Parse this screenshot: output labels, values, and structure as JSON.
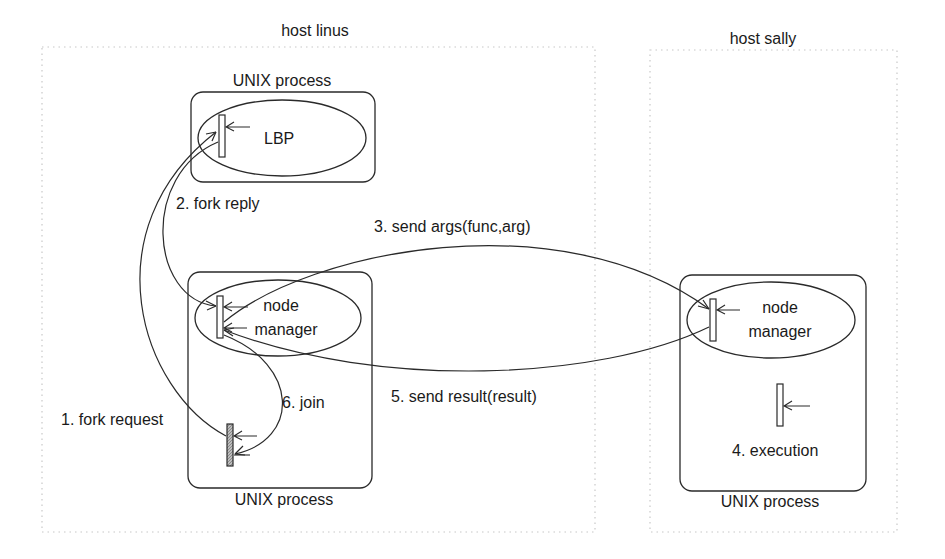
{
  "diagram": {
    "hosts": [
      {
        "id": "linus",
        "label": "host linus"
      },
      {
        "id": "sally",
        "label": "host sally"
      }
    ],
    "processes": [
      {
        "id": "linus-top",
        "label": "UNIX process",
        "component": "LBP"
      },
      {
        "id": "linus-bottom",
        "label": "UNIX process",
        "component_line1": "node",
        "component_line2": "manager"
      },
      {
        "id": "sally-main",
        "label": "UNIX process",
        "component_line1": "node",
        "component_line2": "manager"
      }
    ],
    "steps": [
      {
        "n": 1,
        "label": "1. fork request"
      },
      {
        "n": 2,
        "label": "2. fork reply"
      },
      {
        "n": 3,
        "label": "3. send args(func,arg)"
      },
      {
        "n": 4,
        "label": "4. execution"
      },
      {
        "n": 5,
        "label": "5. send result(result)"
      },
      {
        "n": 6,
        "label": "6. join"
      }
    ],
    "colors": {
      "line": "#2a2a2a",
      "dotted_border": "#c8c8c8",
      "hatched_thread": "#9a9a9a"
    }
  }
}
